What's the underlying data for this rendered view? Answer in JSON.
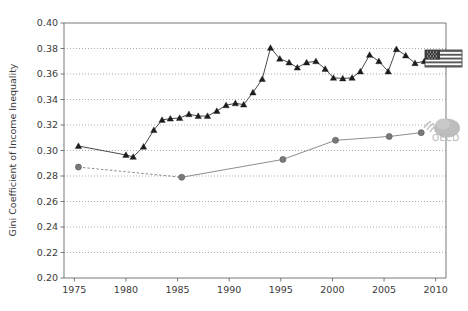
{
  "chart_data": {
    "type": "line",
    "title": "",
    "xlabel": "",
    "ylabel": "Gini Coefficient of Income Inequality",
    "xlim": [
      1974,
      2011
    ],
    "ylim": [
      0.2,
      0.4
    ],
    "grid": true,
    "legend_position": "right-inline",
    "xticks": [
      1975,
      1980,
      1985,
      1990,
      1995,
      2000,
      2005,
      2010
    ],
    "xtick_labels": [
      "1975",
      "1980",
      "1985",
      "1990",
      "1995",
      "2000",
      "2005",
      "2010"
    ],
    "yticks": [
      0.2,
      0.22,
      0.24,
      0.26,
      0.28,
      0.3,
      0.32,
      0.34,
      0.36,
      0.38,
      0.4
    ],
    "ytick_labels": [
      "0.20",
      "0.22",
      "0.24",
      "0.26",
      "0.28",
      "0.30",
      "0.32",
      "0.34",
      "0.36",
      "0.38",
      "0.40"
    ],
    "series": [
      {
        "name": "United States",
        "marker": "triangle",
        "color": "#1c1c1c",
        "linestyle": "solid",
        "legend_icon": "us-flag-icon",
        "x": [
          1975.4,
          1980.0,
          1980.7,
          1981.7,
          1982.7,
          1983.5,
          1984.3,
          1985.2,
          1986.1,
          1987.0,
          1987.9,
          1988.8,
          1989.7,
          1990.6,
          1991.4,
          1992.3,
          1993.2,
          1994.0,
          1994.9,
          1995.8,
          1996.6,
          1997.5,
          1998.4,
          1999.3,
          2000.1,
          2001.0,
          2001.9,
          2002.7,
          2003.6,
          2004.5,
          2005.4,
          2006.2,
          2007.1,
          2008.0,
          2008.9
        ],
        "y": [
          0.3035,
          0.2965,
          0.295,
          0.303,
          0.316,
          0.324,
          0.325,
          0.3255,
          0.3285,
          0.327,
          0.327,
          0.331,
          0.3355,
          0.337,
          0.336,
          0.3455,
          0.356,
          0.3805,
          0.372,
          0.369,
          0.365,
          0.369,
          0.37,
          0.364,
          0.357,
          0.3565,
          0.357,
          0.362,
          0.375,
          0.37,
          0.362,
          0.3795,
          0.3745,
          0.3685,
          0.37
        ]
      },
      {
        "name": "OECD",
        "marker": "circle",
        "color": "#7a7a7a",
        "linestyle_segments": [
          "dashed",
          "solid"
        ],
        "legend_icon": "oecd-logo",
        "x": [
          1975.4,
          1985.4,
          1995.2,
          2000.3,
          2005.5,
          2008.6
        ],
        "y": [
          0.287,
          0.279,
          0.293,
          0.308,
          0.311,
          0.314
        ]
      }
    ]
  },
  "legend": {
    "us_flag_label": "United States",
    "oecd_label": "OECD"
  }
}
